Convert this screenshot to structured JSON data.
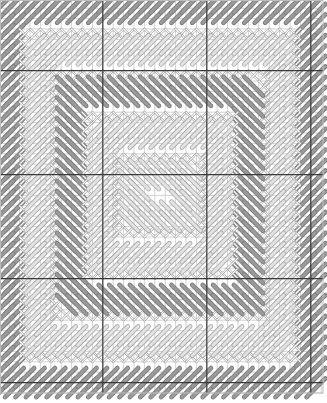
{
  "chart": {
    "title": "",
    "width": 327,
    "height": 403,
    "grid": {
      "origin_x": -1.2,
      "origin_y": -2.2,
      "cell": 10.4,
      "cols": 31,
      "rows": 38,
      "right_edge": 323,
      "bottom_edge": 393,
      "major_every": 10,
      "major_offset_x": 10,
      "major_offset_y": 7,
      "minor_color": "#c8c8c8",
      "major_color": "#3a3a3a",
      "border_color": "#bdbdbd"
    },
    "colors": {
      "dark_stitch": "#9a9a9a",
      "dark_stitch_edge": "#7a7a7a",
      "light_stitch": "#e2e2e2",
      "light_stitch_edge": "#a8a8a8",
      "cross_stitch": "#ffffff",
      "cross_stitch_edge": "#9c9c9c"
    },
    "frames": [
      {
        "x0": 0,
        "y0": 0,
        "x1": 30,
        "y1": 37,
        "type": "dark",
        "dir": "up"
      },
      {
        "x0": 2,
        "y0": 3,
        "x1": 28,
        "y1": 34,
        "type": "cross"
      },
      {
        "x0": 3,
        "y0": 4,
        "x1": 27,
        "y1": 33,
        "type": "light",
        "dir": "up"
      },
      {
        "x0": 5,
        "y0": 7,
        "x1": 25,
        "y1": 30,
        "type": "cross"
      },
      {
        "x0": 6,
        "y0": 8,
        "x1": 24,
        "y1": 29,
        "type": "dark",
        "dir": "down"
      },
      {
        "x0": 8,
        "y0": 11,
        "x1": 22,
        "y1": 26,
        "type": "cross"
      },
      {
        "x0": 9,
        "y0": 12,
        "x1": 21,
        "y1": 25,
        "type": "light",
        "dir": "up"
      },
      {
        "x0": 11,
        "y0": 15,
        "x1": 19,
        "y1": 22,
        "type": "cross"
      },
      {
        "x0": 12,
        "y0": 16,
        "x1": 18,
        "y1": 21,
        "type": "light",
        "dir": "down"
      }
    ]
  }
}
